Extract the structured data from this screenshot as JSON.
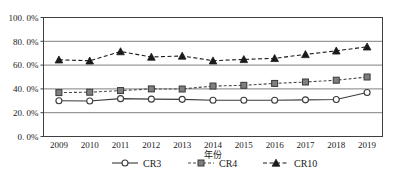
{
  "chart_data": {
    "type": "line",
    "title": "",
    "xlabel": "年份",
    "ylabel": "",
    "x": [
      "2009",
      "2010",
      "2011",
      "2012",
      "2013",
      "2014",
      "2015",
      "2016",
      "2017",
      "2018",
      "2019"
    ],
    "categories": [
      "2009",
      "2010",
      "2011",
      "2012",
      "2013",
      "2014",
      "2015",
      "2016",
      "2017",
      "2018",
      "2019"
    ],
    "ylim": [
      0,
      100
    ],
    "ytick_values": [
      0,
      20,
      40,
      60,
      80,
      100
    ],
    "ytick_labels": [
      "0. 0%",
      "20. 0%",
      "40. 0%",
      "60. 0%",
      "80. 0%",
      "100. 0%"
    ],
    "grid": true,
    "grid_axis": "y",
    "legend_position": "bottom",
    "series": [
      {
        "name": "CR3",
        "marker": "open-circle",
        "linestyle": "solid",
        "color": "#3a3a3a",
        "values": [
          30.0,
          29.8,
          31.8,
          31.4,
          31.2,
          30.5,
          30.4,
          30.4,
          30.8,
          31.1,
          37.0
        ]
      },
      {
        "name": "CR4",
        "marker": "filled-square",
        "linestyle": "dashed",
        "color": "#7f7f7f",
        "values": [
          36.9,
          37.2,
          38.6,
          40.0,
          39.9,
          42.4,
          43.0,
          44.6,
          45.8,
          47.3,
          50.0
        ]
      },
      {
        "name": "CR10",
        "marker": "filled-triangle",
        "linestyle": "dashed",
        "color": "#1a1a1a",
        "values": [
          64.5,
          63.6,
          71.4,
          66.8,
          67.7,
          63.7,
          64.8,
          65.7,
          69.0,
          72.0,
          75.4
        ]
      }
    ]
  },
  "legend": {
    "items": [
      {
        "label": "CR3"
      },
      {
        "label": "CR4"
      },
      {
        "label": "CR10"
      }
    ]
  },
  "colors": {
    "frame": "#404040",
    "gridline": "#808080",
    "cr3": "#3a3a3a",
    "cr4": "#7f7f7f",
    "cr10": "#1a1a1a",
    "text": "#1a1a1a"
  }
}
